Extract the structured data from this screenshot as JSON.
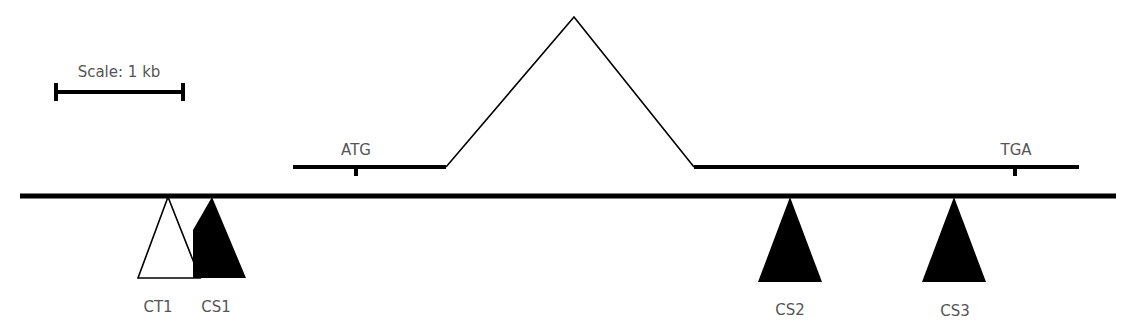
{
  "diagram": {
    "type": "gene-structure",
    "scale_bar": {
      "label": "Scale: 1 kb",
      "x1": 55,
      "x2": 184,
      "y": 92
    },
    "genomic_line": {
      "x1": 20,
      "x2": 1116,
      "y": 196,
      "color": "#000000"
    },
    "gene": {
      "exon1": {
        "x1": 293,
        "x2": 446,
        "y": 167
      },
      "intron": {
        "start_x": 446,
        "peak_x": 574,
        "peak_y": 17,
        "end_x": 694
      },
      "exon2": {
        "x1": 694,
        "x2": 1079,
        "y": 167
      },
      "start_codon": {
        "label": "ATG",
        "x": 356
      },
      "stop_codon": {
        "label": "TGA",
        "x": 1015
      }
    },
    "insertions": [
      {
        "label": "CT1",
        "apex_x": 168,
        "base_left": 138,
        "base_right": 200,
        "fill": "#ffffff"
      },
      {
        "label": "CS1",
        "apex_x": 212,
        "base_left": 193,
        "base_right": 246,
        "fill": "#000000"
      },
      {
        "label": "CS2",
        "apex_x": 790,
        "base_left": 758,
        "base_right": 822,
        "fill": "#000000"
      },
      {
        "label": "CS3",
        "apex_x": 954,
        "base_left": 922,
        "base_right": 986,
        "fill": "#000000"
      }
    ]
  }
}
